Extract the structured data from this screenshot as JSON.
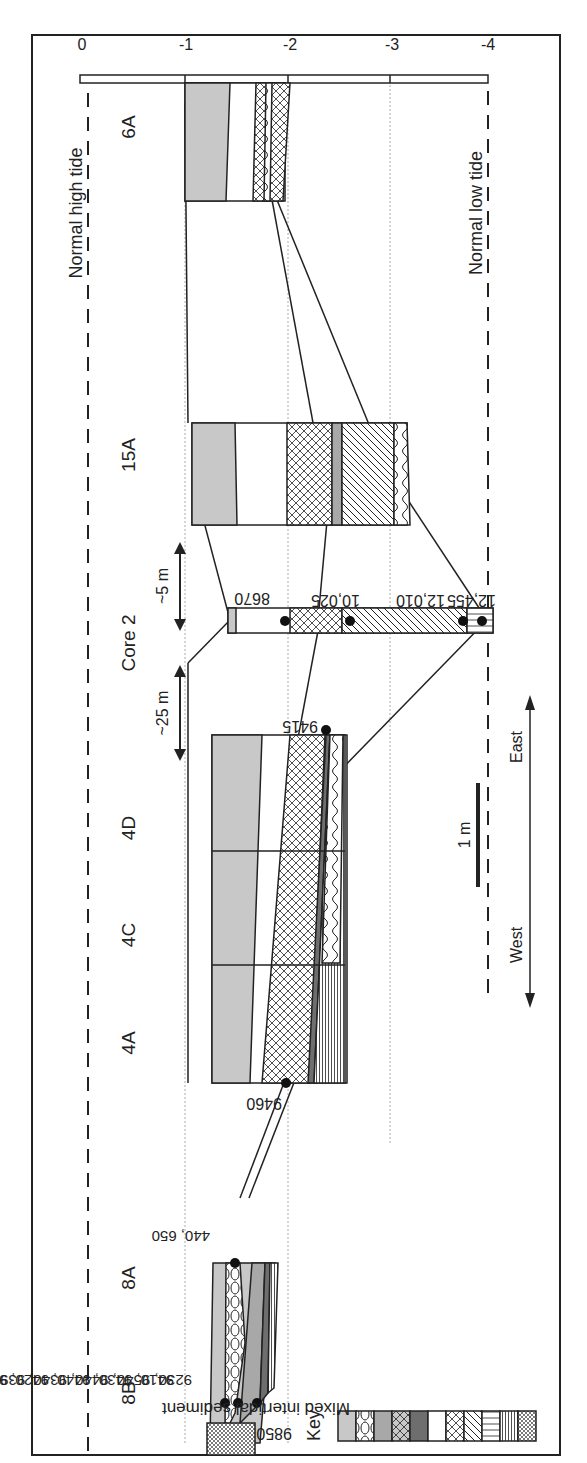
{
  "diagram": {
    "axis": {
      "ticks": [
        "0",
        "-1",
        "-2",
        "-3",
        "-4"
      ]
    },
    "tides": {
      "high": "Normal high tide",
      "low": "Normal low tide"
    },
    "cores": {
      "c8B": "8B",
      "c8A": "8A",
      "c4A": "4A",
      "c4C": "4C",
      "c4D": "4D",
      "core2": "Core 2",
      "c15A": "15A",
      "c6A": "6A"
    },
    "distances": {
      "d25": "~25 m",
      "d5": "~5 m"
    },
    "dates": {
      "d8670": "8670",
      "d10025": "10,025",
      "d12010": "12,010",
      "d12455": "12,455",
      "d9415": "9415",
      "d9460": "9460",
      "d9850": "9850",
      "d8_row1": "9410, 9430, 9440, 9420, 9260",
      "d8_row2": "9230, 9540, 9440, 9340, 9395",
      "d8_row3": "440, 650"
    },
    "scale": {
      "label": "1 m"
    },
    "directions": {
      "west": "West",
      "east": "East"
    },
    "key": {
      "title": "Key",
      "items": [
        "Mixed intertidal sediment",
        "Shell-rich cultural deposits",
        "Shell-free cultural deposits",
        "Mixed intertidal and shell-rich cultural deposits",
        "Paleosol",
        "Shell-rich gravel or shell hash",
        "Mixed terrestrial and intertidal sediment",
        "Peat",
        "Pond sediments",
        "Glacial clay or diamicton",
        "Boulders"
      ]
    },
    "colors": {
      "mixed_intertidal": "#c8c8c8",
      "shell_free": "#a8a8a8",
      "paleosol": "#6e6e6e",
      "line": "#1a1a1a"
    }
  }
}
